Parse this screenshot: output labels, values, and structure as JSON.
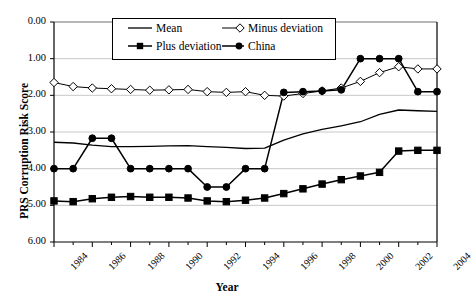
{
  "chart_data": {
    "type": "line",
    "title": "",
    "xlabel": "Year",
    "ylabel": "PRS Corruption Risk Score",
    "x": [
      1984,
      1985,
      1986,
      1987,
      1988,
      1989,
      1990,
      1991,
      1992,
      1993,
      1994,
      1995,
      1996,
      1997,
      1998,
      1999,
      2000,
      2001,
      2002,
      2003,
      2004
    ],
    "xlim": [
      1984,
      2004
    ],
    "ylim": [
      0.0,
      6.0
    ],
    "y_inverted": true,
    "yticks": [
      "0.00",
      "1.00",
      "2.00",
      "3.00",
      "4.00",
      "5.00",
      "6.00"
    ],
    "ytick_values": [
      0,
      1,
      2,
      3,
      4,
      5,
      6
    ],
    "xticks": [
      "1984",
      "1986",
      "1988",
      "1990",
      "1992",
      "1994",
      "1996",
      "1998",
      "2000",
      "2002",
      "2004"
    ],
    "xtick_values": [
      1984,
      1986,
      1988,
      1990,
      1992,
      1994,
      1996,
      1998,
      2000,
      2002,
      2004
    ],
    "grid": "horizontal",
    "legend_position": "top-center",
    "series": [
      {
        "name": "Mean",
        "marker": "none",
        "color": "#000000",
        "values": [
          3.28,
          3.3,
          3.36,
          3.4,
          3.4,
          3.39,
          3.38,
          3.37,
          3.4,
          3.42,
          3.45,
          3.44,
          3.22,
          3.05,
          2.93,
          2.83,
          2.72,
          2.52,
          2.4,
          2.42,
          2.44
        ]
      },
      {
        "name": "Plus deviation",
        "marker": "filled-square",
        "color": "#000000",
        "values": [
          4.88,
          4.9,
          4.82,
          4.78,
          4.76,
          4.78,
          4.78,
          4.8,
          4.88,
          4.9,
          4.86,
          4.8,
          4.68,
          4.55,
          4.42,
          4.3,
          4.2,
          4.1,
          3.52,
          3.5,
          3.5
        ]
      },
      {
        "name": "Minus deviation",
        "marker": "open-diamond",
        "color": "#000000",
        "values": [
          1.65,
          1.76,
          1.8,
          1.82,
          1.84,
          1.86,
          1.85,
          1.84,
          1.9,
          1.92,
          1.9,
          2.0,
          2.02,
          1.95,
          1.88,
          1.8,
          1.62,
          1.38,
          1.22,
          1.28,
          1.28
        ]
      },
      {
        "name": "China",
        "marker": "filled-circle",
        "color": "#000000",
        "values": [
          4.0,
          4.0,
          3.17,
          3.17,
          4.0,
          4.0,
          4.0,
          4.0,
          4.5,
          4.5,
          4.0,
          4.0,
          1.92,
          1.9,
          1.88,
          1.85,
          1.0,
          1.0,
          1.0,
          1.9,
          1.9
        ]
      }
    ],
    "legend": [
      "Mean",
      "Minus deviation",
      "Plus deviation",
      "China"
    ]
  },
  "legend": {
    "mean": "Mean",
    "minus_deviation": "Minus deviation",
    "plus_deviation": "Plus deviation",
    "china": "China"
  },
  "axes": {
    "ylabel": "PRS Corruption Risk Score",
    "xlabel": "Year"
  }
}
